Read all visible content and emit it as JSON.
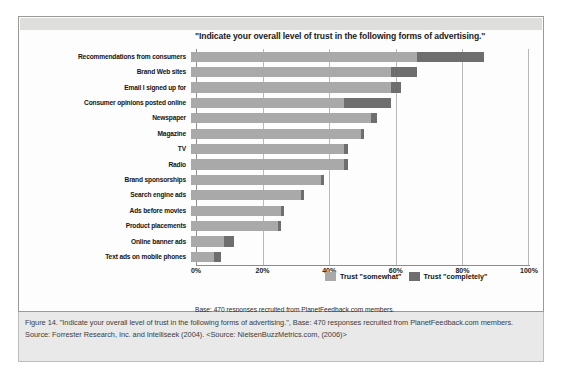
{
  "chart_data": {
    "type": "bar",
    "orientation": "horizontal",
    "stacked": true,
    "title": "\"Indicate your overall level of trust in the following forms of advertising.\"",
    "xlabel": "",
    "ylabel": "",
    "xlim": [
      0,
      100
    ],
    "xticks": [
      "0%",
      "20%",
      "40%",
      "60%",
      "80%",
      "100%"
    ],
    "xtick_values": [
      0,
      20,
      40,
      60,
      80,
      100
    ],
    "grid": true,
    "legend_position": "inside-bottom-right",
    "categories": [
      "Recommendations from consumers",
      "Brand Web sites",
      "Email I signed up for",
      "Consumer opinions posted online",
      "Newspaper",
      "Magazine",
      "TV",
      "Radio",
      "Brand sponsorships",
      "Search engine ads",
      "Ads before movies",
      "Product placements",
      "Online banner ads",
      "Text ads on mobile phones"
    ],
    "series": [
      {
        "name": "Trust \"somewhat\"",
        "color": "#a9a9a9",
        "values": [
          68,
          60,
          60,
          46,
          54,
          51,
          46,
          46,
          39,
          33,
          27,
          26,
          10,
          7
        ]
      },
      {
        "name": "Trust \"completely\"",
        "color": "#6e6e6e",
        "values": [
          20,
          8,
          3,
          14,
          2,
          1,
          1,
          1,
          1,
          1,
          1,
          1,
          3,
          2
        ]
      }
    ],
    "totals": [
      88,
      68,
      63,
      60,
      56,
      52,
      47,
      47,
      40,
      34,
      28,
      27,
      13,
      9
    ],
    "annotations": [
      "Base: 470 responses recruited from PlanetFeedback.com members.",
      "Source: Forrester Research, Inc. and Intelliseek"
    ]
  },
  "figure": {
    "base_line": "Base: 470 responses recruited from PlanetFeedback.com members.",
    "source_line": "Source: Forrester Research, Inc. and Intelliseek"
  },
  "caption": {
    "text": "Figure 14. \"Indicate your overall level of trust in the following forms of advertising.\", Base: 470 responses recruited from PlanetFeedback.com members. Source: Forrester Research, Inc. and Intelliseek (2004). <Source: NielsenBuzzMetrics.com, (2006)>"
  },
  "colors": {
    "somewhat": "#a9a9a9",
    "completely": "#6e6e6e",
    "caption_background": "#e9e9e9",
    "frame_border": "#9a9a9a"
  }
}
